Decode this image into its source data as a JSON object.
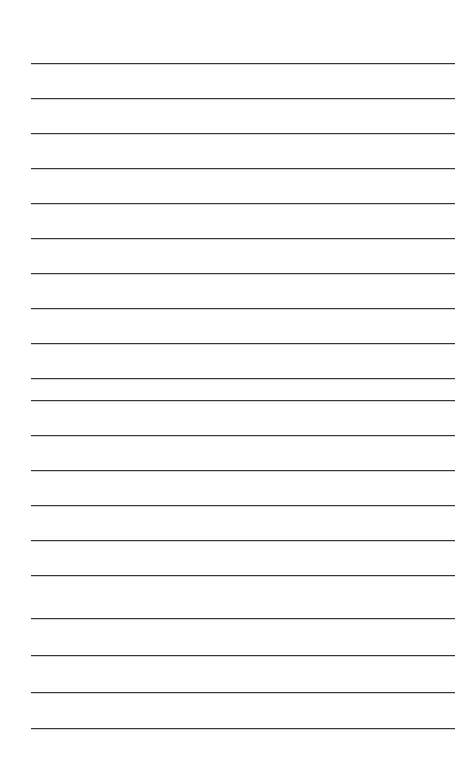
{
  "document": {
    "type": "lined-paper",
    "title": "Blank Ruled Notepad Page",
    "orientation": "portrait",
    "page_width_px": 473,
    "page_height_px": 777,
    "background_color": "#ffffff",
    "has_text_content": false,
    "visible_text": "",
    "notes": "Empty ruled writing sheet: no headings, no handwriting, no page numbers, no margin rule."
  },
  "ruling": {
    "line_color": "#34393e",
    "line_thickness_px": 1.6,
    "line_left_px": 31,
    "line_right_px": 455,
    "line_width_px": 424,
    "first_line_y_px": 63,
    "line_spacing_px": 35,
    "line_count": 20,
    "top_margin_px": 63,
    "bottom_margin_px": 49,
    "left_margin_px": 31,
    "right_margin_px": 18,
    "lines_y_px": [
      63,
      98,
      133,
      168,
      203,
      238,
      273,
      308,
      343,
      378,
      400,
      435,
      470,
      505,
      540,
      575,
      618,
      655,
      692,
      728
    ]
  }
}
